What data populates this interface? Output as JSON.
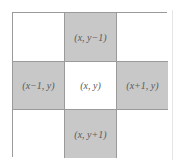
{
  "diagram": {
    "type": "4-neighborhood pixel grid",
    "rows": 3,
    "cols": 3,
    "colors": {
      "shaded_fill": "#c8c8c8",
      "plain_fill": "#ffffff",
      "border": "#9a9a9a",
      "text": "#5a5a5a"
    },
    "cells": [
      {
        "row": 1,
        "col": 1,
        "shaded": false,
        "label": ""
      },
      {
        "row": 1,
        "col": 2,
        "shaded": true,
        "label": "(x, y−1)"
      },
      {
        "row": 1,
        "col": 3,
        "shaded": false,
        "label": ""
      },
      {
        "row": 2,
        "col": 1,
        "shaded": true,
        "label": "(x−1, y)"
      },
      {
        "row": 2,
        "col": 2,
        "shaded": false,
        "label": "(x, y)"
      },
      {
        "row": 2,
        "col": 3,
        "shaded": true,
        "label": "(x+1, y)"
      },
      {
        "row": 3,
        "col": 1,
        "shaded": false,
        "label": ""
      },
      {
        "row": 3,
        "col": 2,
        "shaded": true,
        "label": "(x, y+1)"
      },
      {
        "row": 3,
        "col": 3,
        "shaded": false,
        "label": ""
      }
    ]
  }
}
